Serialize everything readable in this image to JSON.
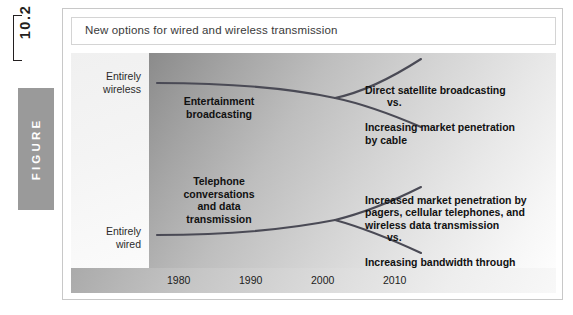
{
  "gutter": {
    "figure_number": "10.2",
    "figure_word": "FIGURE"
  },
  "caption": {
    "title": "New options for wired and wireless transmission"
  },
  "axis_labels": {
    "top": "Entirely\nwireless",
    "bottom": "Entirely\nwired"
  },
  "plot_labels": {
    "upper_left": "Entertainment\nbroadcasting",
    "lower_left": "Telephone\nconversations\nand data\ntransmission",
    "upper_right_a": "Direct satellite broadcasting",
    "upper_right_vs": "vs.",
    "upper_right_b": "Increasing market penetration\nby cable",
    "lower_right_a": "Increased market penetration by\npagers, cellular telephones, and\nwireless data transmission",
    "lower_right_vs": "vs.",
    "lower_right_b": "Increasing bandwidth through\nfiber optics"
  },
  "colors": {
    "figure_box": "#9a9a9a",
    "curve": "#4a4a55",
    "text": "#111111"
  },
  "chart_data": {
    "type": "line",
    "title": "New options for wired and wireless transmission",
    "xlabel": "",
    "ylabel": "",
    "x": [
      1980,
      1990,
      2000,
      2010
    ],
    "x_tick_labels": [
      "1980",
      "1990",
      "2000",
      "2010"
    ],
    "y_category_labels": [
      "Entirely wireless",
      "Entirely wired"
    ],
    "grid": false,
    "legend": "none",
    "series": [
      {
        "name": "Entertainment broadcasting",
        "values": [
          0.88,
          0.86,
          0.84,
          0.84
        ],
        "note": "trunk of upper fork, flat near 'Entirely wireless'"
      },
      {
        "name": "Direct satellite broadcasting",
        "values": [
          null,
          null,
          0.84,
          0.97
        ],
        "note": "upper branch rising toward entirely wireless"
      },
      {
        "name": "Increasing market penetration by cable",
        "values": [
          null,
          null,
          0.84,
          0.7
        ],
        "note": "lower branch descending toward wired"
      },
      {
        "name": "Telephone conversations and data transmission",
        "values": [
          0.12,
          0.13,
          0.16,
          0.16
        ],
        "note": "trunk of lower fork, flat near 'Entirely wired'"
      },
      {
        "name": "Increased market penetration by pagers, cellular telephones, and wireless data transmission",
        "values": [
          null,
          null,
          0.16,
          0.34
        ],
        "note": "lower-section branch rising toward wireless"
      },
      {
        "name": "Increasing bandwidth through fiber optics",
        "values": [
          null,
          null,
          0.16,
          0.04
        ],
        "note": "lower-section branch descending toward wired"
      }
    ]
  },
  "x_ticks": [
    {
      "label": "1980",
      "left": 18
    },
    {
      "label": "1990",
      "left": 90
    },
    {
      "label": "2000",
      "left": 162
    },
    {
      "label": "2010",
      "left": 234
    }
  ]
}
